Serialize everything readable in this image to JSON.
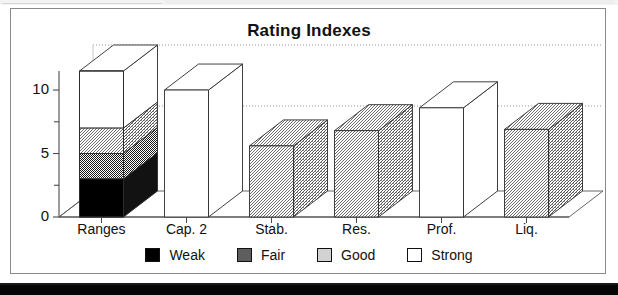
{
  "window": {
    "has_top_strip": true,
    "has_bottom_band": true
  },
  "chart_data": {
    "type": "bar",
    "title": "Rating Indexes",
    "xlabel": "",
    "ylabel": "",
    "ylim": [
      0,
      11.5
    ],
    "yticks": [
      0,
      5,
      10
    ],
    "ytick_labels": [
      "0",
      "5",
      "10"
    ],
    "minor_ticks": [
      2.5,
      7.5
    ],
    "grid": true,
    "gridlines": [
      6.7,
      11.5
    ],
    "style": "3d-column",
    "legend_position": "bottom",
    "categories": [
      "Ranges",
      "Cap. 2",
      "Stab.",
      "Res.",
      "Prof.",
      "Liq."
    ],
    "legend": [
      {
        "name": "Weak",
        "color": "#000000",
        "fill": "solid"
      },
      {
        "name": "Fair",
        "color": "#595959",
        "fill": "dense-dither"
      },
      {
        "name": "Good",
        "color": "#c8c8c8",
        "fill": "light-dither"
      },
      {
        "name": "Strong",
        "color": "#ffffff",
        "fill": "empty"
      }
    ],
    "bars": [
      {
        "category": "Ranges",
        "stacked": true,
        "value": 11.5,
        "segments": [
          {
            "name": "Weak",
            "from": 0,
            "to": 3,
            "value": 3,
            "color": "#000000"
          },
          {
            "name": "Fair",
            "from": 3,
            "to": 5,
            "value": 2,
            "color": "#595959"
          },
          {
            "name": "Good",
            "from": 5,
            "to": 7,
            "value": 2,
            "color": "#c8c8c8"
          },
          {
            "name": "Strong",
            "from": 7,
            "to": 11.5,
            "value": 4.5,
            "color": "#ffffff"
          }
        ]
      },
      {
        "category": "Cap. 2",
        "stacked": false,
        "value": 10.0,
        "rating": "Strong",
        "color": "#ffffff"
      },
      {
        "category": "Stab.",
        "stacked": false,
        "value": 5.6,
        "rating": "Good",
        "color": "#c8c8c8"
      },
      {
        "category": "Res.",
        "stacked": false,
        "value": 6.8,
        "rating": "Good",
        "color": "#c8c8c8"
      },
      {
        "category": "Prof.",
        "stacked": false,
        "value": 8.6,
        "rating": "Strong",
        "color": "#ffffff"
      },
      {
        "category": "Liq.",
        "stacked": false,
        "value": 6.9,
        "rating": "Good",
        "color": "#c8c8c8"
      }
    ]
  }
}
